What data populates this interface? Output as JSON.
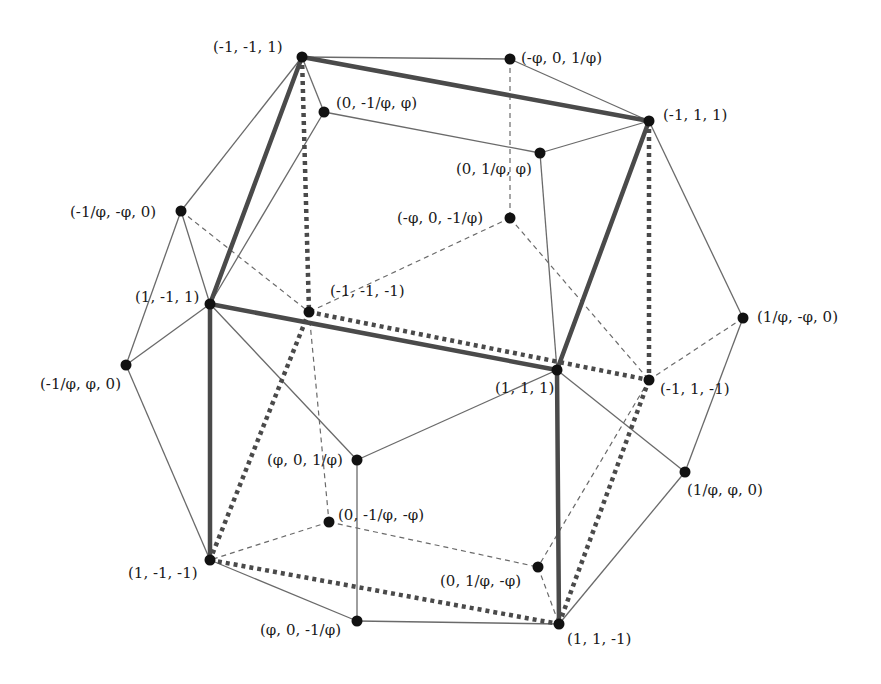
{
  "figure": {
    "colors": {
      "background": "#ffffff",
      "edge": "#6a6a6a",
      "cube_edge": "#4a4a4a",
      "vertex": "#111111",
      "label": "#1a1a1a"
    },
    "vertices": [
      {
        "id": "v1",
        "label": "(-1, -1, 1)",
        "x": 302,
        "y": 57,
        "lx": 213,
        "ly": 40
      },
      {
        "id": "v2",
        "label": "(-φ, 0, 1/φ)",
        "x": 510,
        "y": 59,
        "lx": 521,
        "ly": 51
      },
      {
        "id": "v3",
        "label": "(0, -1/φ, φ)",
        "x": 324,
        "y": 112,
        "lx": 336,
        "ly": 96
      },
      {
        "id": "v4",
        "label": "(-1, 1, 1)",
        "x": 649,
        "y": 121,
        "lx": 663,
        "ly": 108
      },
      {
        "id": "v5",
        "label": "(0, 1/φ, φ)",
        "x": 540,
        "y": 153,
        "lx": 456,
        "ly": 162
      },
      {
        "id": "v6",
        "label": "(-1/φ, -φ, 0)",
        "x": 181,
        "y": 211,
        "lx": 70,
        "ly": 205
      },
      {
        "id": "v7",
        "label": "(-φ, 0, -1/φ)",
        "x": 510,
        "y": 218,
        "lx": 397,
        "ly": 211
      },
      {
        "id": "v8",
        "label": "(1, -1, 1)",
        "x": 210,
        "y": 304,
        "lx": 135,
        "ly": 290
      },
      {
        "id": "v9",
        "label": "(-1, -1, -1)",
        "x": 309,
        "y": 312,
        "lx": 330,
        "ly": 284
      },
      {
        "id": "v10",
        "label": "(1/φ, -φ, 0)",
        "x": 743,
        "y": 318,
        "lx": 757,
        "ly": 310
      },
      {
        "id": "v11",
        "label": "(1, 1, 1)",
        "x": 557,
        "y": 370,
        "lx": 495,
        "ly": 381
      },
      {
        "id": "v12",
        "label": "(-1, 1, -1)",
        "x": 649,
        "y": 380,
        "lx": 660,
        "ly": 382
      },
      {
        "id": "v13",
        "label": "(-1/φ, φ, 0)",
        "x": 126,
        "y": 365,
        "lx": 40,
        "ly": 377
      },
      {
        "id": "v14",
        "label": "(φ, 0, 1/φ)",
        "x": 357,
        "y": 460,
        "lx": 267,
        "ly": 453
      },
      {
        "id": "v15",
        "label": "(1/φ, φ, 0)",
        "x": 685,
        "y": 472,
        "lx": 687,
        "ly": 483
      },
      {
        "id": "v16",
        "label": "(0, -1/φ, -φ)",
        "x": 329,
        "y": 522,
        "lx": 338,
        "ly": 508
      },
      {
        "id": "v17",
        "label": "(1, -1, -1)",
        "x": 210,
        "y": 560,
        "lx": 128,
        "ly": 566
      },
      {
        "id": "v18",
        "label": "(0, 1/φ, -φ)",
        "x": 538,
        "y": 567,
        "lx": 440,
        "ly": 574
      },
      {
        "id": "v19",
        "label": "(φ, 0, -1/φ)",
        "x": 357,
        "y": 621,
        "lx": 260,
        "ly": 623
      },
      {
        "id": "v20",
        "label": "(1, 1, -1)",
        "x": 559,
        "y": 624,
        "lx": 567,
        "ly": 632
      }
    ],
    "edges_visible": [
      [
        "v1",
        "v2"
      ],
      [
        "v1",
        "v3"
      ],
      [
        "v1",
        "v6"
      ],
      [
        "v2",
        "v4"
      ],
      [
        "v3",
        "v5"
      ],
      [
        "v4",
        "v5"
      ],
      [
        "v4",
        "v10"
      ],
      [
        "v5",
        "v11"
      ],
      [
        "v3",
        "v8"
      ],
      [
        "v6",
        "v8"
      ],
      [
        "v6",
        "v13"
      ],
      [
        "v8",
        "v13"
      ],
      [
        "v8",
        "v14"
      ],
      [
        "v11",
        "v14"
      ],
      [
        "v11",
        "v15"
      ],
      [
        "v10",
        "v15"
      ],
      [
        "v13",
        "v17"
      ],
      [
        "v14",
        "v19"
      ],
      [
        "v17",
        "v19"
      ],
      [
        "v19",
        "v20"
      ],
      [
        "v15",
        "v20"
      ]
    ],
    "edges_hidden": [
      [
        "v2",
        "v7"
      ],
      [
        "v7",
        "v9"
      ],
      [
        "v7",
        "v12"
      ],
      [
        "v6",
        "v9"
      ],
      [
        "v9",
        "v16"
      ],
      [
        "v10",
        "v12"
      ],
      [
        "v16",
        "v17"
      ],
      [
        "v16",
        "v18"
      ],
      [
        "v12",
        "v18"
      ],
      [
        "v18",
        "v20"
      ]
    ],
    "cube_edges_visible": [
      [
        "v1",
        "v4"
      ],
      [
        "v1",
        "v8"
      ],
      [
        "v4",
        "v11"
      ],
      [
        "v8",
        "v11"
      ],
      [
        "v8",
        "v17"
      ],
      [
        "v11",
        "v20"
      ]
    ],
    "cube_edges_hidden": [
      [
        "v1",
        "v9"
      ],
      [
        "v4",
        "v12"
      ],
      [
        "v9",
        "v12"
      ],
      [
        "v9",
        "v17"
      ],
      [
        "v12",
        "v20"
      ],
      [
        "v17",
        "v20"
      ]
    ]
  }
}
